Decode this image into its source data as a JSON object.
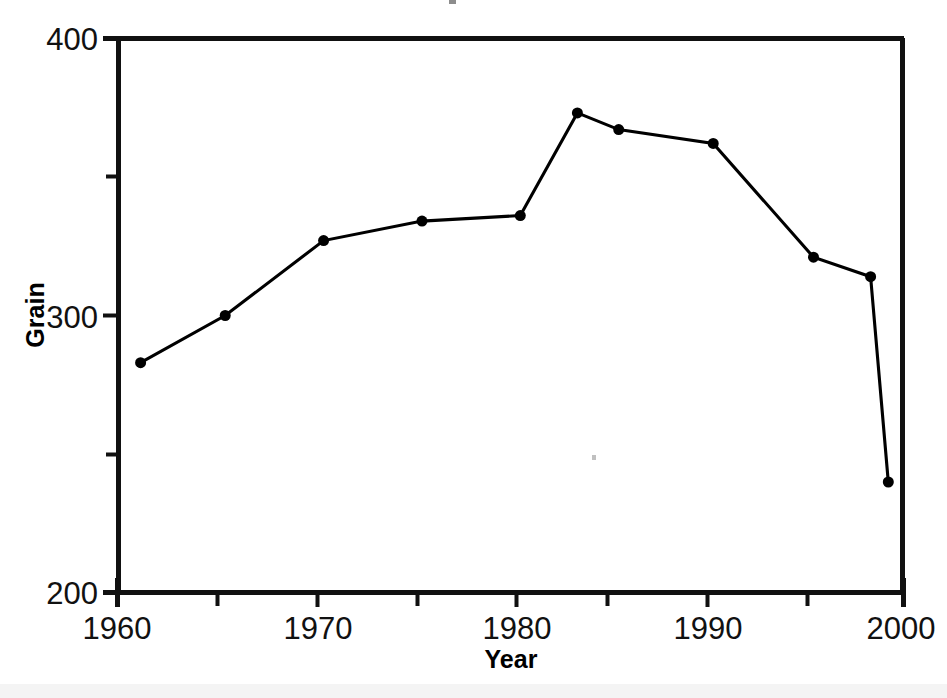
{
  "figure": {
    "background_color": "#ffffff",
    "ink_color": "#000000",
    "plot_frame": {
      "left_px": 117,
      "right_px": 904,
      "top_px": 38,
      "bottom_px": 593,
      "border": "full-box"
    }
  },
  "chart_data": {
    "type": "line",
    "title": "",
    "subtitle": "",
    "xlabel": "Year",
    "ylabel": "Grain",
    "xlim": [
      1960,
      2000
    ],
    "ylim": [
      200,
      400
    ],
    "xticks": [
      1960,
      1970,
      1980,
      1990,
      2000
    ],
    "xtick_labels": [
      "1960",
      "1970",
      "1980",
      "1990",
      "2000"
    ],
    "xticks_minor": [
      1965,
      1975,
      1985,
      1995
    ],
    "yticks": [
      200,
      300,
      400
    ],
    "ytick_labels": [
      "200",
      "300",
      "400"
    ],
    "yticks_minor": [
      250,
      350
    ],
    "grid": false,
    "legend": false,
    "legend_position": "none",
    "marker": "filled-circle",
    "marker_size_px": 11,
    "line_width_px": 3,
    "series": [
      {
        "name": "Grain",
        "x": [
          1961.2,
          1965.5,
          1970.5,
          1975.5,
          1980.5,
          1983.4,
          1985.5,
          1990.3,
          1995.4,
          1998.3,
          1999.2
        ],
        "y": [
          283,
          300,
          327,
          334,
          336,
          373,
          367,
          362,
          321,
          314,
          240
        ]
      }
    ],
    "annotations": []
  },
  "labels": {
    "y_axis_title": "Grain",
    "x_axis_title": "Year",
    "y_top": "400",
    "y_mid": "300",
    "y_bottom": "200",
    "x_1960": "1960",
    "x_1970": "1970",
    "x_1980": "1980",
    "x_1990": "1990",
    "x_2000": "2000"
  }
}
